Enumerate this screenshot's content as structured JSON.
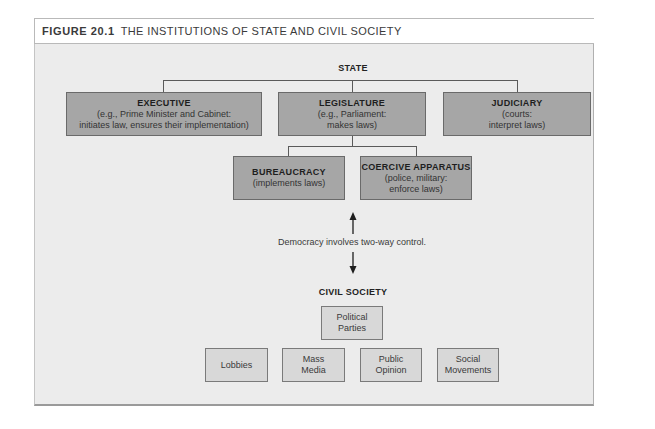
{
  "figure": {
    "number": "FIGURE 20.1",
    "title": "THE INSTITUTIONS OF STATE AND CIVIL SOCIETY"
  },
  "state": {
    "heading": "STATE",
    "branches": [
      {
        "name": "EXECUTIVE",
        "line1": "(e.g., Prime Minister and Cabinet:",
        "line2": "initiates law, ensures their implementation)"
      },
      {
        "name": "LEGISLATURE",
        "line1": "(e.g., Parliament:",
        "line2": "makes laws)"
      },
      {
        "name": "JUDICIARY",
        "line1": "(courts:",
        "line2": "interpret laws)"
      }
    ],
    "sub_branches": [
      {
        "name": "BUREAUCRACY",
        "line1": "(implements laws)"
      },
      {
        "name": "COERCIVE APPARATUS",
        "line1": "(police, military:",
        "line2": "enforce laws)"
      }
    ]
  },
  "link": {
    "caption": "Democracy involves two-way control.",
    "up_arrow": "arrow-up-icon",
    "down_arrow": "arrow-down-icon"
  },
  "civil_society": {
    "heading": "CIVIL SOCIETY",
    "top": {
      "line1": "Political",
      "line2": "Parties"
    },
    "items": [
      {
        "line1": "Lobbies"
      },
      {
        "line1": "Mass",
        "line2": "Media"
      },
      {
        "line1": "Public",
        "line2": "Opinion"
      },
      {
        "line1": "Social",
        "line2": "Movements"
      }
    ]
  },
  "colors": {
    "state_box": "#a6a6a6",
    "civil_box": "#d8d8d8",
    "panel": "#ececec"
  }
}
